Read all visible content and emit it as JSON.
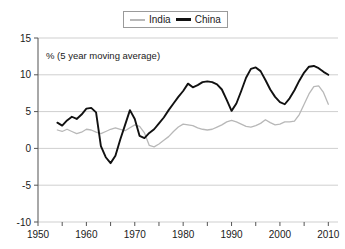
{
  "chart_data": {
    "type": "line",
    "title": "",
    "subtitle": "",
    "annotation": "% (5 year moving average)",
    "xlabel": "",
    "ylabel": "",
    "xlim": [
      1950,
      2012
    ],
    "ylim": [
      -10,
      15
    ],
    "yticks": [
      15,
      10,
      5,
      0,
      -5,
      -10
    ],
    "xticks": [
      1950,
      1960,
      1970,
      1980,
      1990,
      2000,
      2010
    ],
    "xminor_ticks": [
      1955,
      1965,
      1975,
      1985,
      1995,
      2005
    ],
    "grid": true,
    "grid_axis": "y",
    "legend_position": "top-center",
    "series": [
      {
        "name": "India",
        "color": "#b8b8b8",
        "x": [
          1954,
          1955,
          1956,
          1957,
          1958,
          1959,
          1960,
          1961,
          1962,
          1963,
          1964,
          1965,
          1966,
          1967,
          1968,
          1969,
          1970,
          1971,
          1972,
          1973,
          1974,
          1975,
          1976,
          1977,
          1978,
          1979,
          1980,
          1981,
          1982,
          1983,
          1984,
          1985,
          1986,
          1987,
          1988,
          1989,
          1990,
          1991,
          1992,
          1993,
          1994,
          1995,
          1996,
          1997,
          1998,
          1999,
          2000,
          2001,
          2002,
          2003,
          2004,
          2005,
          2006,
          2007,
          2008,
          2009,
          2010
        ],
        "values": [
          2.5,
          2.3,
          2.6,
          2.3,
          2.0,
          2.2,
          2.6,
          2.5,
          2.2,
          2.0,
          2.3,
          2.6,
          2.8,
          2.6,
          2.4,
          2.8,
          3.2,
          3.0,
          2.1,
          0.4,
          0.2,
          0.6,
          1.1,
          1.6,
          2.3,
          2.9,
          3.3,
          3.2,
          3.1,
          2.8,
          2.6,
          2.5,
          2.6,
          2.9,
          3.2,
          3.6,
          3.8,
          3.6,
          3.3,
          3.0,
          2.9,
          3.1,
          3.4,
          3.9,
          3.5,
          3.2,
          3.3,
          3.6,
          3.6,
          3.7,
          4.6,
          6.0,
          7.4,
          8.4,
          8.5,
          7.6,
          6.0
        ]
      },
      {
        "name": "China",
        "color": "#111111",
        "x": [
          1954,
          1955,
          1956,
          1957,
          1958,
          1959,
          1960,
          1961,
          1962,
          1963,
          1964,
          1965,
          1966,
          1967,
          1968,
          1969,
          1970,
          1971,
          1972,
          1973,
          1974,
          1975,
          1976,
          1977,
          1978,
          1979,
          1980,
          1981,
          1982,
          1983,
          1984,
          1985,
          1986,
          1987,
          1988,
          1989,
          1990,
          1991,
          1992,
          1993,
          1994,
          1995,
          1996,
          1997,
          1998,
          1999,
          2000,
          2001,
          2002,
          2003,
          2004,
          2005,
          2006,
          2007,
          2008,
          2009,
          2010
        ],
        "values": [
          3.5,
          3.1,
          3.8,
          4.3,
          4.0,
          4.6,
          5.4,
          5.5,
          4.9,
          0.3,
          -1.2,
          -2.0,
          -1.0,
          1.2,
          3.2,
          5.2,
          4.0,
          1.7,
          1.4,
          2.1,
          2.6,
          3.4,
          4.2,
          5.2,
          6.1,
          7.0,
          7.8,
          8.8,
          8.3,
          8.6,
          9.0,
          9.1,
          9.0,
          8.7,
          8.0,
          6.6,
          5.1,
          6.1,
          7.8,
          9.6,
          10.8,
          11.0,
          10.5,
          9.3,
          8.0,
          7.0,
          6.3,
          6.0,
          6.8,
          7.9,
          9.2,
          10.3,
          11.1,
          11.2,
          10.9,
          10.4,
          10.0
        ]
      }
    ]
  },
  "legend": {
    "entries": [
      {
        "label": "India"
      },
      {
        "label": "China"
      }
    ]
  }
}
